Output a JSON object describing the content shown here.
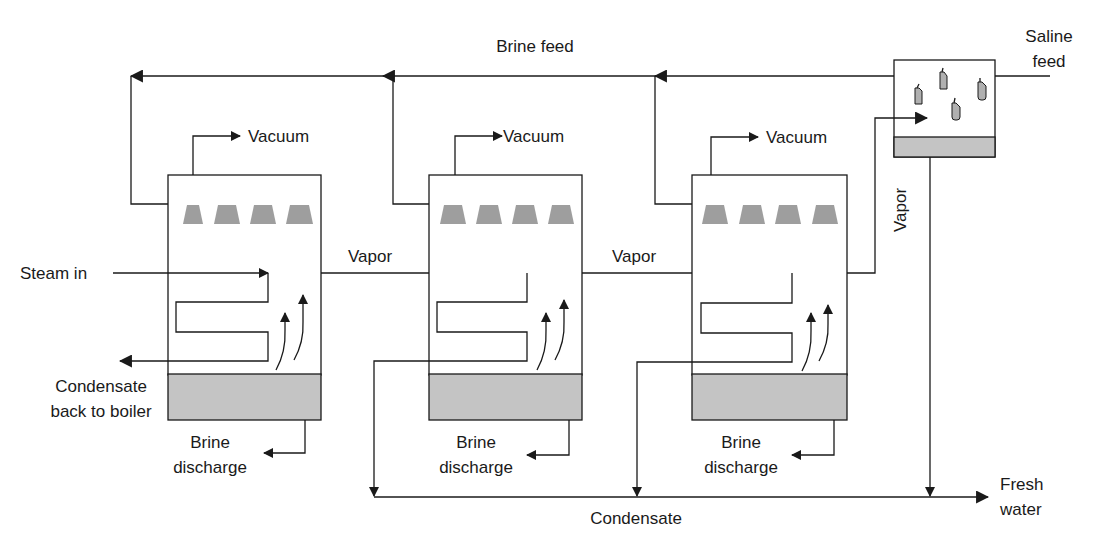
{
  "diagram": {
    "colors": {
      "line": "#1a1a1a",
      "brine_pool": "#c4c4c4",
      "spray_nozzle": "#9e9e9e",
      "condenser_tubes": "#b0b0b0"
    },
    "labels": {
      "brine_feed": "Brine feed",
      "saline_feed_line1": "Saline",
      "saline_feed_line2": "feed",
      "steam_in": "Steam in",
      "condensate_back_line1": "Condensate",
      "condensate_back_line2": "back to boiler",
      "vacuum": "Vacuum",
      "vapor": "Vapor",
      "brine_discharge_line1": "Brine",
      "brine_discharge_line2": "discharge",
      "condensate": "Condensate",
      "fresh_water_line1": "Fresh",
      "fresh_water_line2": "water"
    },
    "effects": [
      {
        "name": "effect-1",
        "vacuum": "Vacuum",
        "discharge1": "Brine",
        "discharge2": "discharge"
      },
      {
        "name": "effect-2",
        "vacuum": "Vacuum",
        "discharge1": "Brine",
        "discharge2": "discharge"
      },
      {
        "name": "effect-3",
        "vacuum": "Vacuum",
        "discharge1": "Brine",
        "discharge2": "discharge"
      }
    ],
    "vapor_labels": [
      "Vapor",
      "Vapor",
      "Vapor"
    ]
  }
}
